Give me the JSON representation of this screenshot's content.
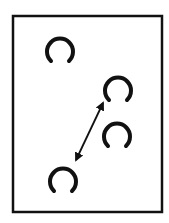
{
  "diagram": {
    "frame": {
      "x": 13,
      "y": 16,
      "width": 149,
      "height": 196,
      "stroke": "#111111"
    },
    "shapes": [
      {
        "id": "c1",
        "type": "landolt-c",
        "cx": 60,
        "cy": 51,
        "r": 13,
        "gap": "bottom"
      },
      {
        "id": "c2",
        "type": "landolt-c",
        "cx": 118,
        "cy": 90,
        "r": 13,
        "gap": "bottom"
      },
      {
        "id": "c3",
        "type": "landolt-c",
        "cx": 117,
        "cy": 136,
        "r": 13,
        "gap": "bottom"
      },
      {
        "id": "c4",
        "type": "landolt-c",
        "cx": 63,
        "cy": 181,
        "r": 13,
        "gap": "bottom"
      }
    ],
    "arrow": {
      "type": "double-headed",
      "from": "c4",
      "to": "c2",
      "x1": 76,
      "y1": 160,
      "x2": 103,
      "y2": 103
    }
  }
}
